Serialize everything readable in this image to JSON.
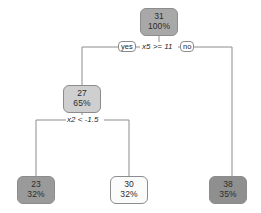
{
  "diagram": {
    "type": "decision-tree",
    "title": "",
    "nodes": [
      {
        "id": "root",
        "value": "31",
        "percent": "100%",
        "fill": "#a8a8a8",
        "x": 140,
        "y": 8,
        "w": 38,
        "h": 28
      },
      {
        "id": "left",
        "value": "27",
        "percent": "65%",
        "fill": "#cfcfcf",
        "x": 63,
        "y": 85,
        "w": 38,
        "h": 28
      },
      {
        "id": "leaf1",
        "value": "23",
        "percent": "32%",
        "fill": "#9a9a9a",
        "x": 17,
        "y": 176,
        "w": 38,
        "h": 28
      },
      {
        "id": "leaf2",
        "value": "30",
        "percent": "32%",
        "fill": "#fbfbfb",
        "x": 110,
        "y": 176,
        "w": 38,
        "h": 28
      },
      {
        "id": "leaf3",
        "value": "38",
        "percent": "35%",
        "fill": "#8f8f8f",
        "x": 209,
        "y": 176,
        "w": 38,
        "h": 28
      }
    ],
    "splits": [
      {
        "id": "split1",
        "variable": "x5",
        "operator": ">=",
        "threshold": "11",
        "label": "x5 >= 11",
        "yes_label": "yes",
        "no_label": "no"
      },
      {
        "id": "split2",
        "variable": "x2",
        "operator": "<",
        "threshold": "-1.5",
        "label": "x2 < -1.5",
        "yes_label": "",
        "no_label": ""
      }
    ],
    "colors": {
      "edge": "#8c8c8c",
      "text": "#1f1f1f",
      "background": "#ffffff"
    }
  }
}
